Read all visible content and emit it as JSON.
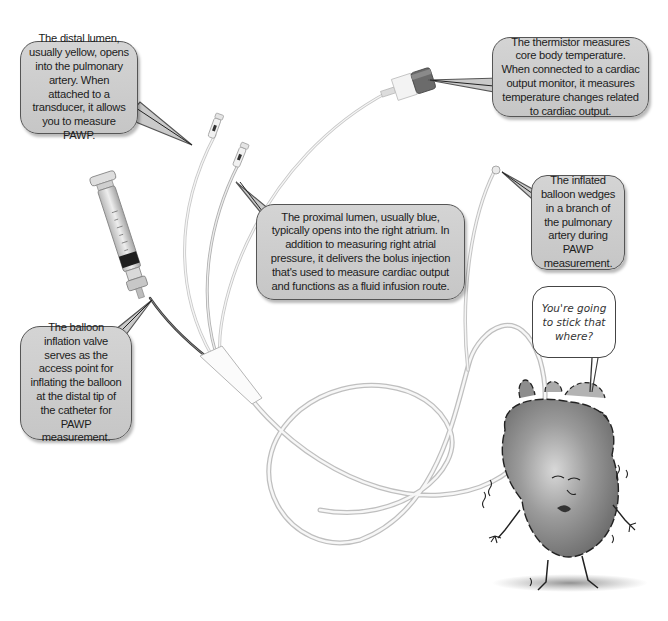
{
  "figure": {
    "callouts": {
      "distal_lumen": "The distal lumen, usually yellow, opens into the pulmonary artery. When attached to a transducer, it allows you to measure PAWP.",
      "thermistor": "The thermistor measures core body temperature. When connected to a cardiac output monitor, it measures temperature changes related to cardiac output.",
      "proximal_lumen": "The proximal lumen, usually blue, typically opens into the right atrium. In addition to measuring right atrial pressure, it delivers the bolus injection that's used to measure cardiac output and functions as a fluid infusion route.",
      "inflated_balloon": "The inflated balloon wedges in a branch of the pulmonary artery during PAWP measurement.",
      "balloon_inflation_valve": "The balloon inflation valve serves as the access point for inflating the balloon at the distal tip of the catheter for PAWP measurement."
    },
    "cartoon": {
      "character": "heart",
      "speech": "You're going to stick that where?"
    }
  }
}
